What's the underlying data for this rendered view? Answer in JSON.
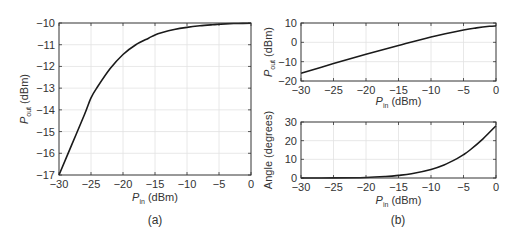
{
  "chart_data": [
    {
      "id": "a",
      "type": "line",
      "caption": "(a)",
      "xlabel": {
        "main": "P",
        "sub": "in",
        "unit": " (dBm)"
      },
      "ylabel": {
        "main": "P",
        "sub": "out",
        "unit": " (dBm)"
      },
      "xlim": [
        -30,
        0
      ],
      "ylim": [
        -17,
        -10
      ],
      "xticks": [
        -30,
        -25,
        -20,
        -15,
        -10,
        -5,
        0
      ],
      "yticks": [
        -17,
        -16,
        -15,
        -14,
        -13,
        -12,
        -11,
        -10
      ],
      "xtick_labels": [
        "−30",
        "−25",
        "−20",
        "−15",
        "−10",
        "−5",
        "0"
      ],
      "ytick_labels": [
        "−17",
        "−16",
        "−15",
        "−14",
        "−13",
        "−12",
        "−11",
        "−10"
      ],
      "grid": true,
      "series": [
        {
          "name": "Pout vs Pin",
          "x": [
            -30,
            -28,
            -26,
            -25,
            -24,
            -22,
            -20,
            -18,
            -16,
            -15,
            -14,
            -12,
            -10,
            -8,
            -6,
            -5,
            -4,
            -2,
            0
          ],
          "y": [
            -17,
            -15.6,
            -14.2,
            -13.45,
            -12.95,
            -12.1,
            -11.45,
            -11.0,
            -10.7,
            -10.55,
            -10.45,
            -10.3,
            -10.2,
            -10.13,
            -10.08,
            -10.06,
            -10.04,
            -10.02,
            -10.01
          ]
        }
      ]
    },
    {
      "id": "b-top",
      "type": "line",
      "caption": "(b)",
      "xlabel": {
        "main": "P",
        "sub": "in",
        "unit": " (dBm)"
      },
      "ylabel": {
        "main": "P",
        "sub": "out",
        "unit": " (dBm)"
      },
      "xlim": [
        -30,
        0
      ],
      "ylim": [
        -20,
        10
      ],
      "xticks": [
        -30,
        -25,
        -20,
        -15,
        -10,
        -5,
        0
      ],
      "yticks": [
        -20,
        -10,
        0,
        10
      ],
      "xtick_labels": [
        "−30",
        "−25",
        "−20",
        "−15",
        "−10",
        "−5",
        "0"
      ],
      "ytick_labels": [
        "−20",
        "−10",
        "0",
        "10"
      ],
      "grid": true,
      "series": [
        {
          "name": "Pout vs Pin",
          "x": [
            -30,
            -25,
            -20,
            -15,
            -10,
            -5,
            -3,
            -1,
            0
          ],
          "y": [
            -16,
            -11,
            -6.2,
            -1.6,
            2.8,
            6.4,
            7.5,
            8.3,
            8.5
          ]
        }
      ]
    },
    {
      "id": "b-bottom",
      "type": "line",
      "caption": "",
      "xlabel": {
        "main": "P",
        "sub": "in",
        "unit": " (dBm)"
      },
      "ylabel": {
        "main": "Angle (degrees)",
        "sub": "",
        "unit": ""
      },
      "xlim": [
        -30,
        0
      ],
      "ylim": [
        0,
        30
      ],
      "xticks": [
        -30,
        -25,
        -20,
        -15,
        -10,
        -5,
        0
      ],
      "yticks": [
        0,
        10,
        20,
        30
      ],
      "xtick_labels": [
        "−30",
        "−25",
        "−20",
        "−15",
        "−10",
        "−5",
        "0"
      ],
      "ytick_labels": [
        "0",
        "10",
        "20",
        "30"
      ],
      "grid": true,
      "series": [
        {
          "name": "Angle vs Pin",
          "x": [
            -30,
            -25,
            -20,
            -17,
            -15,
            -13,
            -10,
            -8,
            -6,
            -5,
            -4,
            -2,
            0
          ],
          "y": [
            0,
            0.05,
            0.3,
            0.8,
            1.4,
            2.3,
            4.6,
            7.0,
            10.4,
            12.5,
            15.0,
            21.0,
            28.0
          ]
        }
      ]
    }
  ]
}
